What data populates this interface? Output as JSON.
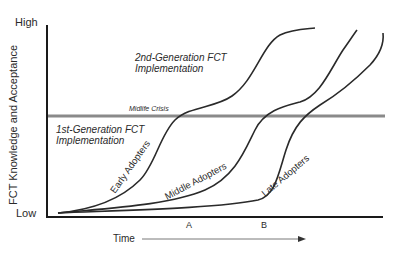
{
  "diagram": {
    "y_axis": {
      "label": "FCT Knowledge and Acceptance",
      "high_label": "High",
      "low_label": "Low"
    },
    "x_axis": {
      "label": "Time",
      "markers": [
        "A",
        "B"
      ]
    },
    "threshold_line": {
      "label": "Midlife Crisis"
    },
    "regions": {
      "upper": [
        "2nd-Generation FCT",
        "Implementation"
      ],
      "lower": [
        "1st-Generation FCT",
        "Implementation"
      ]
    },
    "curves": [
      {
        "name": "Early Adopters"
      },
      {
        "name": "Middle Adopters"
      },
      {
        "name": "Late Adopters"
      }
    ],
    "colors": {
      "line": "#2a2a2a",
      "threshold": "#8a8a8a"
    }
  }
}
